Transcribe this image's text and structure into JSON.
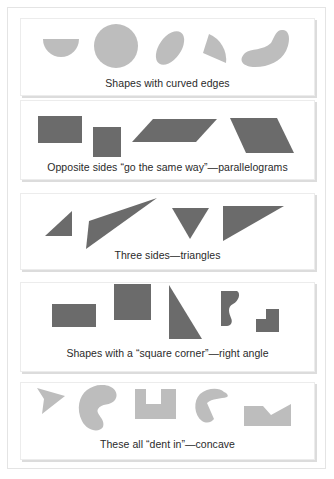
{
  "colors": {
    "light_shape": "#bdbdbd",
    "dark_shape": "#6b6b6b",
    "caption_text": "#2a2a2a",
    "panel_border": "#ececec"
  },
  "panels": [
    {
      "caption": "Shapes with curved edges",
      "shape_tone": "light",
      "shapes": [
        "half-circle",
        "circle",
        "ellipse",
        "circle-sector",
        "kidney-curve"
      ]
    },
    {
      "caption": "Opposite sides “go the same way”—parallelograms",
      "shape_tone": "dark",
      "shapes": [
        "rectangle",
        "square",
        "slanted-parallelogram",
        "wide-parallelogram"
      ]
    },
    {
      "caption": "Three sides—triangles",
      "shape_tone": "dark",
      "shapes": [
        "small-right-triangle",
        "long-thin-triangle",
        "inverted-triangle",
        "wide-triangle"
      ]
    },
    {
      "caption": "Shapes with a “square corner”—right angle",
      "shape_tone": "dark",
      "shapes": [
        "rectangle",
        "square",
        "right-triangle",
        "wavy-edge-shape",
        "l-shape"
      ]
    },
    {
      "caption": "These all “dent in”—concave",
      "shape_tone": "light",
      "shapes": [
        "arrowhead",
        "c-blob",
        "u-shape",
        "pac-shape",
        "notched-rectangle"
      ]
    }
  ]
}
